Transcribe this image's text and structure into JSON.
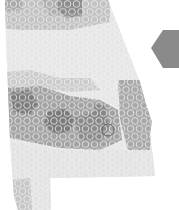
{
  "map": {
    "region": "Alabama",
    "style": "grayscale hexbin density",
    "colors": {
      "background": "#ffffff",
      "lightest": "#e4e4e4",
      "light": "#d2d2d2",
      "mid": "#b4b4b4",
      "dark": "#8e8e8e",
      "darkest": "#6e6e6e",
      "hex_outline": "#f2f2f2",
      "marker_stroke": "#5a5a5a",
      "side_hex": "#8a8a8a"
    },
    "marker": {
      "type": "circle-outline",
      "x": 108,
      "y": 130,
      "r": 6
    },
    "side_shape": {
      "type": "hexagon",
      "partially_visible": true
    }
  }
}
